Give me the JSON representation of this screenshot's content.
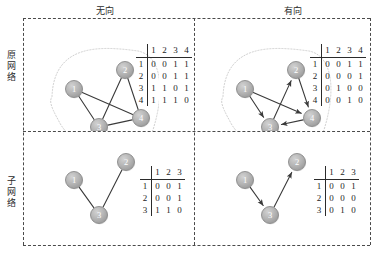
{
  "headers": {
    "col_undirected": "无向",
    "col_directed": "有向",
    "row_original": "原网络",
    "row_sub": "子网络"
  },
  "colors": {
    "node_fill": "#b3b3b3",
    "node_stroke": "#8a8a8a",
    "node_label": "#ffffff",
    "edge": "#3a3a3a",
    "frame_dash": "#4a4a4a",
    "blob_dotted": "#c9c9c9",
    "text": "#1c1c1c"
  },
  "panels": {
    "original_undirected": {
      "name": "original-undirected",
      "directed": false,
      "nodes": [
        {
          "id": "1",
          "x": 50,
          "y": 70
        },
        {
          "id": "2",
          "x": 101,
          "y": 51
        },
        {
          "id": "3",
          "x": 75,
          "y": 108
        },
        {
          "id": "4",
          "x": 117,
          "y": 99
        }
      ],
      "edges": [
        {
          "from": "1",
          "to": "3"
        },
        {
          "from": "1",
          "to": "4"
        },
        {
          "from": "2",
          "to": "3"
        },
        {
          "from": "2",
          "to": "4"
        },
        {
          "from": "3",
          "to": "4"
        }
      ],
      "blob": true,
      "matrix": {
        "columns": [
          "1",
          "2",
          "3",
          "4"
        ],
        "rows": [
          "1",
          "2",
          "3",
          "4"
        ],
        "values": [
          [
            "0",
            "0",
            "1",
            "1"
          ],
          [
            "0",
            "0",
            "1",
            "1"
          ],
          [
            "1",
            "1",
            "0",
            "1"
          ],
          [
            "1",
            "1",
            "1",
            "0"
          ]
        ]
      }
    },
    "original_directed": {
      "name": "original-directed",
      "directed": true,
      "nodes": [
        {
          "id": "1",
          "x": 26,
          "y": 70
        },
        {
          "id": "2",
          "x": 77,
          "y": 51
        },
        {
          "id": "3",
          "x": 51,
          "y": 108
        },
        {
          "id": "4",
          "x": 93,
          "y": 99
        }
      ],
      "edges": [
        {
          "from": "1",
          "to": "3"
        },
        {
          "from": "1",
          "to": "4"
        },
        {
          "from": "2",
          "to": "4"
        },
        {
          "from": "3",
          "to": "2"
        },
        {
          "from": "4",
          "to": "3"
        }
      ],
      "blob": true,
      "matrix": {
        "columns": [
          "1",
          "2",
          "3",
          "4"
        ],
        "rows": [
          "1",
          "2",
          "3",
          "4"
        ],
        "values": [
          [
            "0",
            "0",
            "1",
            "1"
          ],
          [
            "0",
            "0",
            "0",
            "1"
          ],
          [
            "0",
            "1",
            "0",
            "0"
          ],
          [
            "0",
            "0",
            "1",
            "0"
          ]
        ]
      }
    },
    "sub_undirected": {
      "name": "sub-undirected",
      "directed": false,
      "nodes": [
        {
          "id": "1",
          "x": 50,
          "y": 50
        },
        {
          "id": "2",
          "x": 102,
          "y": 32
        },
        {
          "id": "3",
          "x": 75,
          "y": 85
        }
      ],
      "edges": [
        {
          "from": "1",
          "to": "3"
        },
        {
          "from": "2",
          "to": "3"
        }
      ],
      "blob": false,
      "matrix": {
        "columns": [
          "1",
          "2",
          "3"
        ],
        "rows": [
          "1",
          "2",
          "3"
        ],
        "values": [
          [
            "0",
            "0",
            "1"
          ],
          [
            "0",
            "0",
            "1"
          ],
          [
            "1",
            "1",
            "0"
          ]
        ]
      }
    },
    "sub_directed": {
      "name": "sub-directed",
      "directed": true,
      "nodes": [
        {
          "id": "1",
          "x": 26,
          "y": 50
        },
        {
          "id": "2",
          "x": 78,
          "y": 32
        },
        {
          "id": "3",
          "x": 51,
          "y": 85
        }
      ],
      "edges": [
        {
          "from": "1",
          "to": "3"
        },
        {
          "from": "3",
          "to": "2"
        }
      ],
      "blob": false,
      "matrix": {
        "columns": [
          "1",
          "2",
          "3"
        ],
        "rows": [
          "1",
          "2",
          "3"
        ],
        "values": [
          [
            "0",
            "0",
            "1"
          ],
          [
            "0",
            "0",
            "0"
          ],
          [
            "0",
            "1",
            "0"
          ]
        ]
      }
    }
  }
}
